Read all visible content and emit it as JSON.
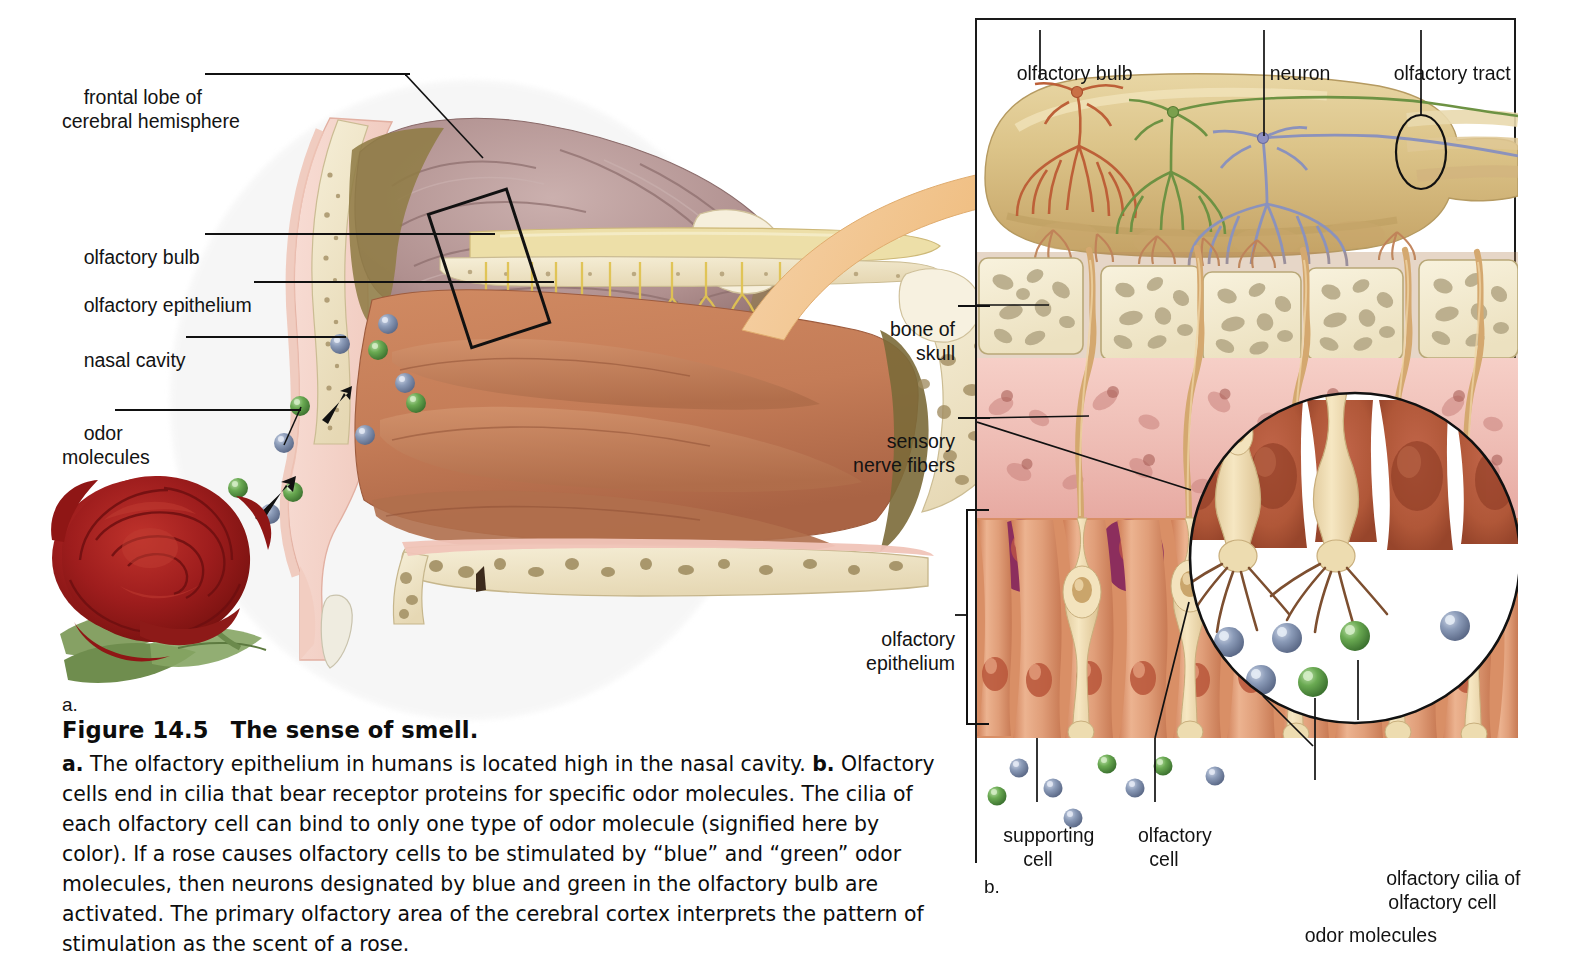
{
  "figure": {
    "number": "Figure 14.5",
    "title": "The sense of smell.",
    "caption_parts": {
      "a_tag": "a.",
      "a_text": " The olfactory epithelium in humans is located high in the nasal cavity. ",
      "b_tag": "b.",
      "b_text": " Olfactory cells end in cilia that bear receptor proteins for specific odor molecules. The cilia of each olfactory cell can bind to only one type of odor molecule (signified here by color). If a rose causes olfactory cells to be stimulated by “blue” and “green” odor molecules, then neurons designated by blue and green in the olfactory bulb are activated. The primary olfactory area of the cerebral cortex interprets the pattern of stimulation as the scent of a rose."
    },
    "panel_a_letter": "a.",
    "panel_b_letter": "b."
  },
  "panel_a": {
    "labels": {
      "frontal_lobe": "frontal lobe of\ncerebral hemisphere",
      "olfactory_bulb": "olfactory bulb",
      "olfactory_epithelium": "olfactory epithelium",
      "nasal_cavity": "nasal cavity",
      "odor_molecules": "odor\nmolecules"
    }
  },
  "panel_b": {
    "labels": {
      "olfactory_bulb": "olfactory bulb",
      "neuron": "neuron",
      "olfactory_tract": "olfactory tract",
      "bone_of_skull": "bone of\nskull",
      "sensory_nerve_fibers": "sensory\nnerve fibers",
      "olfactory_epithelium": "olfactory\nepithelium",
      "supporting_cell": "supporting\ncell",
      "olfactory_cell": "olfactory\ncell",
      "olfactory_cilia": "olfactory cilia of\nolfactory cell",
      "odor_molecules": "odor molecules"
    }
  },
  "colors": {
    "odor_molecule_blue": "#7c8cab",
    "odor_molecule_green": "#5f9f4e",
    "neuron_orange": "#c0623a",
    "neuron_green": "#6f9244",
    "neuron_blue": "#8189b4",
    "bulb_tan": "#d9b87a",
    "bone_cream": "#f3ead0",
    "connective_pink": "#efc3bd",
    "epithelium_orange": "#e0a07c",
    "supporting_purple": "#93305e",
    "olfactory_cell_cream": "#efdcae",
    "nasal_mucosa": "#c87e5c",
    "brain_mauve": "#b79a9b",
    "arrow_peach": "#f0c08e",
    "rose_red": "#a81d20",
    "leaf_green": "#6f8f4e",
    "nerve_yellow": "#e6c95f",
    "skin_pink": "#f4d3c9"
  }
}
